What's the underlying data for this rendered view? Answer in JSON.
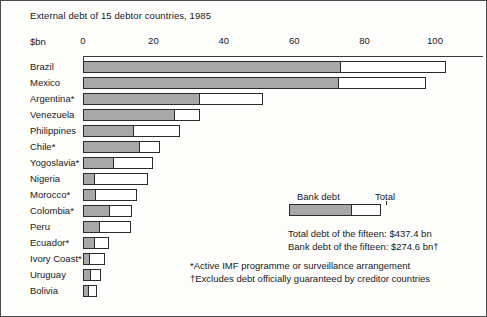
{
  "chart_data": {
    "type": "bar",
    "orientation": "horizontal",
    "stacked": false,
    "title": "External debt of 15 debtor countries, 1985",
    "units_label": "$bn",
    "xlabel": "",
    "ylabel": "",
    "xlim": [
      0,
      110
    ],
    "xticks": [
      0,
      20,
      40,
      60,
      80,
      100
    ],
    "xtick_labels": [
      "0",
      "20",
      "40",
      "60",
      "80",
      "100"
    ],
    "grid": false,
    "legend_position": "middle-right",
    "categories": [
      "Brazil",
      "Mexico",
      "Argentina*",
      "Venezuela",
      "Philippines",
      "Chile*",
      "Yogoslavia*",
      "Nigeria",
      "Morocco*",
      "Colombia*",
      "Peru",
      "Ecuador*",
      "Ivory Coast*",
      "Uruguay",
      "Bolivia"
    ],
    "series": [
      {
        "name": "Bank debt",
        "values": [
          73.0,
          72.5,
          33.0,
          25.8,
          14.2,
          16.0,
          8.6,
          3.1,
          3.4,
          7.4,
          4.6,
          3.0,
          1.8,
          1.9,
          1.3
        ]
      },
      {
        "name": "Total",
        "values": [
          103.0,
          97.5,
          51.0,
          33.2,
          27.5,
          21.8,
          20.0,
          18.6,
          15.4,
          14.0,
          13.7,
          7.5,
          6.3,
          5.2,
          4.0
        ]
      }
    ],
    "legend": {
      "bank_label": "Bank debt",
      "total_label": "Total"
    },
    "annotations": [
      "Total debt of the fifteen: $437.4 bn",
      "Bank debt of the fifteen: $274.6 bn†"
    ],
    "footnotes": [
      "*Active IMF programme or surveillance arrangement",
      "†Excludes debt officially guaranteed by creditor countries"
    ],
    "colors": {
      "bank_debt_fill": "#a8a8a8",
      "total_fill": "#ffffff",
      "outline": "#2b2b2b",
      "background": "#fdfdfc",
      "text": "#1a1a1a"
    }
  }
}
